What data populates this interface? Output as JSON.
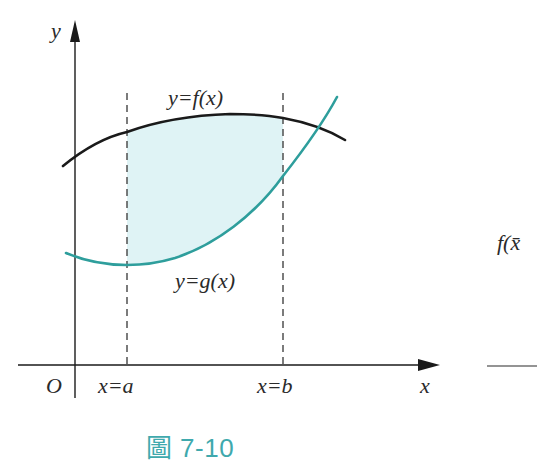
{
  "figure": {
    "caption": "圖 7-10",
    "labels": {
      "y_axis": "y",
      "x_axis": "x",
      "origin": "O",
      "f_curve": "y=f(x)",
      "g_curve": "y=g(x)",
      "line_a": "x=a",
      "line_b": "x=b",
      "right_partial": "f(x̄"
    },
    "colors": {
      "f_curve": "#1a1a1a",
      "g_curve": "#2e9e9c",
      "shade": "#dff3f5",
      "axis": "#1a1a1a",
      "dashed": "#444444",
      "caption": "#3fa9ad"
    }
  }
}
